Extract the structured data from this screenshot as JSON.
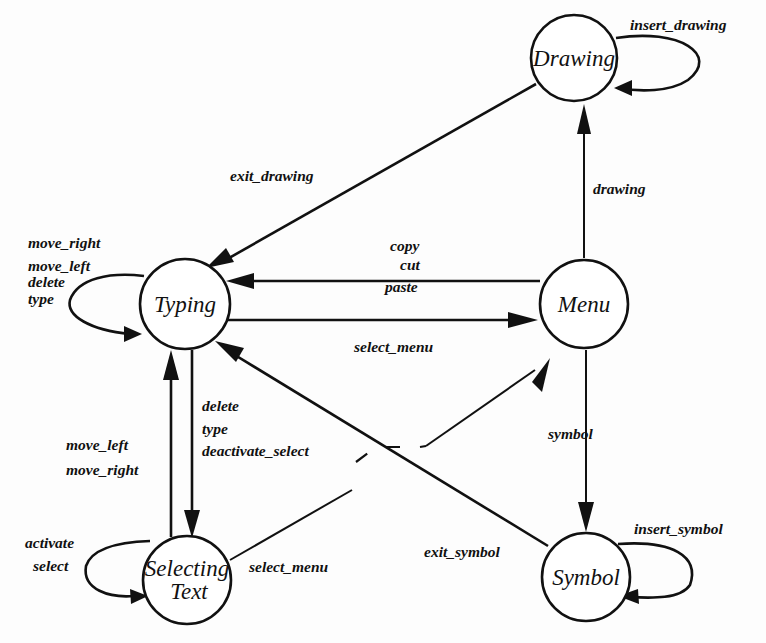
{
  "diagram": {
    "type": "state-transition-diagram",
    "states": [
      {
        "id": "drawing",
        "label": "Drawing"
      },
      {
        "id": "typing",
        "label": "Typing"
      },
      {
        "id": "menu",
        "label": "Menu"
      },
      {
        "id": "selecting_text",
        "label_line1": "Selecting",
        "label_line2": "Text"
      },
      {
        "id": "symbol",
        "label": "Symbol"
      }
    ],
    "transitions": {
      "drawing_self": {
        "from": "Drawing",
        "to": "Drawing",
        "label": "insert_drawing"
      },
      "drawing_to_typing": {
        "from": "Drawing",
        "to": "Typing",
        "label": "exit_drawing"
      },
      "menu_to_drawing": {
        "from": "Menu",
        "to": "Drawing",
        "label": "drawing"
      },
      "typing_self": {
        "from": "Typing",
        "to": "Typing",
        "labels": [
          "move_right",
          "move_left",
          "delete",
          "type"
        ]
      },
      "menu_to_typing": {
        "from": "Menu",
        "to": "Typing",
        "labels": [
          "copy",
          "cut",
          "paste"
        ]
      },
      "typing_to_menu": {
        "from": "Typing",
        "to": "Menu",
        "label": "select_menu"
      },
      "typing_to_selecting": {
        "from": "Typing",
        "to": "Selecting Text",
        "labels": [
          "delete",
          "type",
          "deactivate_select"
        ]
      },
      "selecting_to_typing": {
        "from": "Selecting Text",
        "to": "Typing",
        "labels": [
          "move_left",
          "move_right"
        ]
      },
      "selecting_self": {
        "from": "Selecting Text",
        "to": "Selecting Text",
        "labels": [
          "activate",
          "select"
        ]
      },
      "selecting_to_menu": {
        "from": "Selecting Text",
        "to": "Menu",
        "label": "select_menu"
      },
      "menu_to_symbol": {
        "from": "Menu",
        "to": "Symbol",
        "label": "symbol"
      },
      "symbol_to_typing": {
        "from": "Symbol",
        "to": "Typing",
        "label": "exit_symbol"
      },
      "symbol_self": {
        "from": "Symbol",
        "to": "Symbol",
        "label": "insert_symbol"
      }
    }
  }
}
